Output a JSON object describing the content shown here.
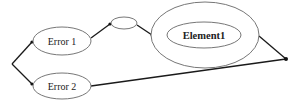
{
  "diagram": {
    "nodes": [
      {
        "id": "error1",
        "label": "Error 1"
      },
      {
        "id": "error2",
        "label": "Error 2"
      },
      {
        "id": "small",
        "label": ""
      },
      {
        "id": "outer",
        "label": ""
      },
      {
        "id": "element1",
        "label": "Element1"
      }
    ],
    "edges": [
      {
        "from": "start",
        "to": "error1"
      },
      {
        "from": "start",
        "to": "error2"
      },
      {
        "from": "error1",
        "to": "small"
      },
      {
        "from": "small",
        "to": "outer"
      },
      {
        "from": "outer",
        "to": "end"
      },
      {
        "from": "error2",
        "to": "end"
      }
    ]
  }
}
